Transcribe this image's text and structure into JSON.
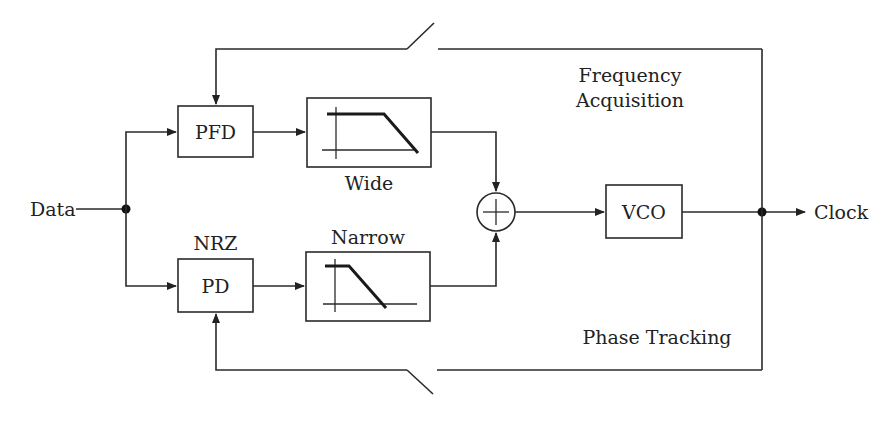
{
  "diagram": {
    "type": "block-diagram",
    "labels": {
      "input": "Data",
      "output": "Clock",
      "pfd": "PFD",
      "nrz": "NRZ",
      "pd": "PD",
      "wide": "Wide",
      "narrow": "Narrow",
      "vco": "VCO",
      "freq_line1": "Frequency",
      "freq_line2": "Acquisition",
      "phase": "Phase Tracking"
    },
    "blocks": [
      {
        "id": "pfd",
        "label": "PFD"
      },
      {
        "id": "wide-lpf",
        "label": "Wide",
        "kind": "low-pass filter"
      },
      {
        "id": "pd",
        "label": "PD",
        "caption": "NRZ"
      },
      {
        "id": "narrow-lpf",
        "label": "Narrow",
        "kind": "low-pass filter"
      },
      {
        "id": "summer",
        "label": "+"
      },
      {
        "id": "vco",
        "label": "VCO"
      }
    ],
    "loops": [
      {
        "name": "Frequency Acquisition",
        "switch": "top"
      },
      {
        "name": "Phase Tracking",
        "switch": "bottom"
      }
    ],
    "colors": {
      "stroke": "#2a2a2a",
      "background": "#ffffff"
    }
  }
}
